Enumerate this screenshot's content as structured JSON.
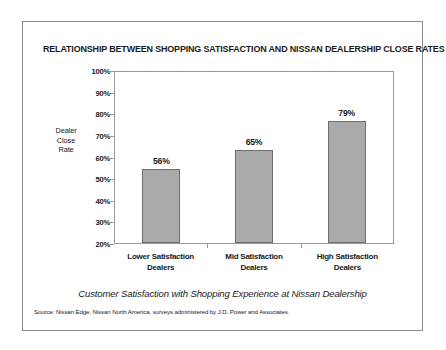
{
  "chart_data": {
    "type": "bar",
    "title": "RELATIONSHIP BETWEEN SHOPPING SATISFACTION AND NISSAN DEALERSHIP CLOSE RATES",
    "categories": [
      "Lower Satisfaction\nDealers",
      "Mid Satisfaction\nDealers",
      "High Satisfaction\nDealers"
    ],
    "category_lines": [
      [
        "Lower Satisfaction",
        "Dealers"
      ],
      [
        "Mid Satisfaction",
        "Dealers"
      ],
      [
        "High Satisfaction",
        "Dealers"
      ]
    ],
    "values": [
      56,
      65,
      79
    ],
    "data_labels": [
      "56%",
      "65%",
      "79%"
    ],
    "xlabel": "",
    "ylabel": "Dealer\nClose\nRate",
    "ylabel_lines": [
      "Dealer",
      "Close",
      "Rate"
    ],
    "ylim": [
      20,
      100
    ],
    "ytick_values": [
      100,
      90,
      80,
      70,
      60,
      50,
      40,
      30,
      20
    ],
    "ytick_labels": [
      "100%",
      "90%",
      "80%",
      "70%",
      "60%",
      "50%",
      "40%",
      "30%",
      "20%"
    ],
    "grid": false,
    "legend": null,
    "bar_color": "#aaaaaa",
    "bar_edge_color": "#6e6e6e"
  },
  "caption": "Customer Satisfaction with Shopping Experience at Nissan Dealership",
  "source": "Source: Nissan Edge, Nissan North America, surveys administered by J.D. Power and Associates.",
  "colors": {
    "frame": "#8c8c8c",
    "axis": "#9a9a9a",
    "text": "#1a1a1a",
    "background": "#ffffff"
  }
}
